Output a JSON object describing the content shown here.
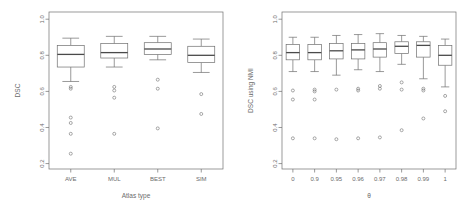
{
  "figure": {
    "background": "#ffffff",
    "line_color": "#6f6f6f",
    "median_color": "#4a4a4a",
    "text_color": "#6b6b6b",
    "panel_count": 2
  },
  "chart_data": [
    {
      "type": "box",
      "panel": "left",
      "title": "",
      "xlabel": "Atlas type",
      "ylabel": "DSC",
      "ylim": [
        0.17,
        1.04
      ],
      "yticks": [
        0.2,
        0.4,
        0.6,
        0.8,
        1.0
      ],
      "yticklabels": [
        "0.2",
        "0.4",
        "0.6",
        "0.8",
        "1.0"
      ],
      "grid": false,
      "legend": "none",
      "categories": [
        "AVE",
        "MUL",
        "BEST",
        "SIM"
      ],
      "boxes": [
        {
          "category": "AVE",
          "whisker_low": 0.655,
          "q1": 0.735,
          "median": 0.805,
          "q3": 0.855,
          "whisker_high": 0.895,
          "outliers": [
            0.625,
            0.615,
            0.455,
            0.425,
            0.365,
            0.255
          ]
        },
        {
          "category": "MUL",
          "whisker_low": 0.735,
          "q1": 0.785,
          "median": 0.815,
          "q3": 0.865,
          "whisker_high": 0.905,
          "outliers": [
            0.625,
            0.605,
            0.565,
            0.365
          ]
        },
        {
          "category": "BEST",
          "whisker_low": 0.775,
          "q1": 0.805,
          "median": 0.835,
          "q3": 0.87,
          "whisker_high": 0.905,
          "outliers": [
            0.665,
            0.615,
            0.395
          ]
        },
        {
          "category": "SIM",
          "whisker_low": 0.705,
          "q1": 0.76,
          "median": 0.8,
          "q3": 0.85,
          "whisker_high": 0.89,
          "outliers": [
            0.585,
            0.475
          ]
        }
      ]
    },
    {
      "type": "box",
      "panel": "right",
      "title": "",
      "xlabel": "θ",
      "ylabel": "DSC using NMI",
      "ylim": [
        0.17,
        1.04
      ],
      "yticks": [
        0.2,
        0.4,
        0.6,
        0.8,
        1.0
      ],
      "yticklabels": [
        "0.2",
        "0.4",
        "0.6",
        "0.8",
        "1.0"
      ],
      "grid": false,
      "legend": "none",
      "categories": [
        "0",
        "0.9",
        "0.95",
        "0.96",
        "0.97",
        "0.98",
        "0.99",
        "1"
      ],
      "boxes": [
        {
          "category": "0",
          "whisker_low": 0.71,
          "q1": 0.775,
          "median": 0.815,
          "q3": 0.86,
          "whisker_high": 0.9,
          "outliers": [
            0.605,
            0.555,
            0.34
          ]
        },
        {
          "category": "0.9",
          "whisker_low": 0.71,
          "q1": 0.775,
          "median": 0.815,
          "q3": 0.86,
          "whisker_high": 0.9,
          "outliers": [
            0.61,
            0.6,
            0.555,
            0.34
          ]
        },
        {
          "category": "0.95",
          "whisker_low": 0.69,
          "q1": 0.78,
          "median": 0.825,
          "q3": 0.865,
          "whisker_high": 0.91,
          "outliers": [
            0.61,
            0.335
          ]
        },
        {
          "category": "0.96",
          "whisker_low": 0.72,
          "q1": 0.78,
          "median": 0.83,
          "q3": 0.865,
          "whisker_high": 0.915,
          "outliers": [
            0.615,
            0.605,
            0.34
          ]
        },
        {
          "category": "0.97",
          "whisker_low": 0.71,
          "q1": 0.79,
          "median": 0.835,
          "q3": 0.87,
          "whisker_high": 0.92,
          "outliers": [
            0.63,
            0.615,
            0.345
          ]
        },
        {
          "category": "0.98",
          "whisker_low": 0.75,
          "q1": 0.81,
          "median": 0.85,
          "q3": 0.875,
          "whisker_high": 0.91,
          "outliers": [
            0.65,
            0.61,
            0.385
          ]
        },
        {
          "category": "0.99",
          "whisker_low": 0.67,
          "q1": 0.79,
          "median": 0.855,
          "q3": 0.875,
          "whisker_high": 0.905,
          "outliers": [
            0.615,
            0.605,
            0.45
          ]
        },
        {
          "category": "1",
          "whisker_low": 0.625,
          "q1": 0.745,
          "median": 0.8,
          "q3": 0.855,
          "whisker_high": 0.89,
          "outliers": [
            0.575,
            0.49
          ]
        }
      ]
    }
  ]
}
